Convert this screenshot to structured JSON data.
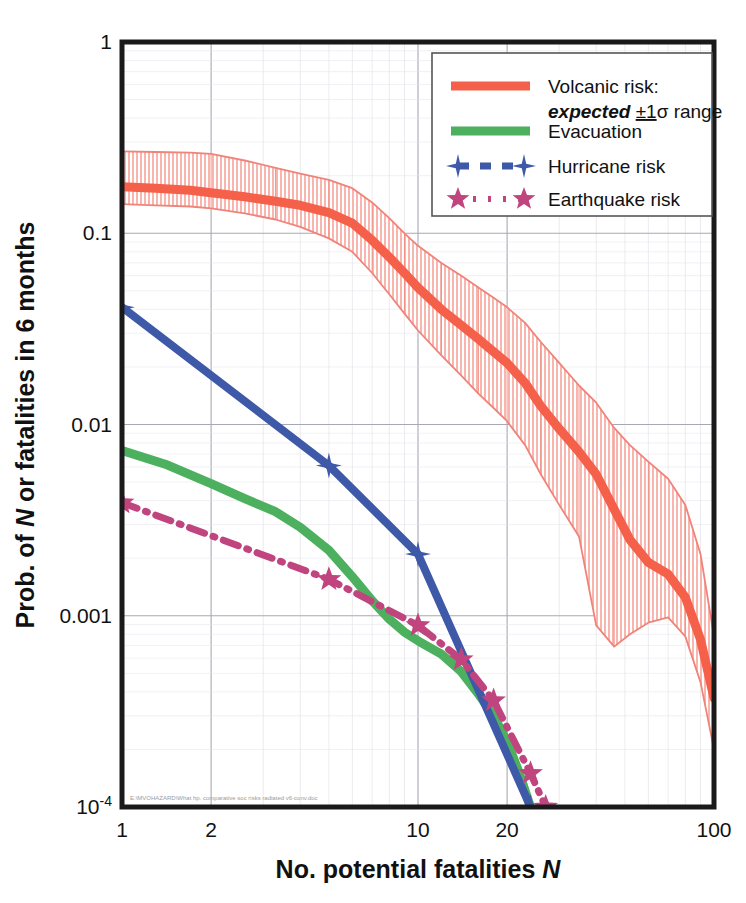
{
  "chart_data": {
    "type": "line",
    "title": "",
    "xlabel": "No. potential fatalities N",
    "ylabel": "Prob. of N or fatalities in 6 months",
    "xscale": "log",
    "yscale": "log",
    "xlim": [
      1,
      100
    ],
    "ylim": [
      0.0001,
      1
    ],
    "xticks": [
      "1",
      "2",
      "10",
      "20",
      "100"
    ],
    "xtick_values": [
      1,
      2,
      10,
      20,
      100
    ],
    "yticks": [
      "1",
      "0.1",
      "0.01",
      "0.001",
      "10-4"
    ],
    "ytick_values": [
      1,
      0.1,
      0.01,
      0.001,
      0.0001
    ],
    "grid": true,
    "legend_position": "top-right",
    "legend": [
      {
        "label": "Volcanic risk:",
        "label2": "expected",
        "label2b": "±1",
        "label2c": "σ",
        "label2d": " range",
        "color": "#f4604a",
        "style": "band"
      },
      {
        "label": "Evacuation",
        "color": "#4cb05f",
        "style": "thick-line"
      },
      {
        "label": "Hurricane risk",
        "color": "#3d59a8",
        "style": "dashed-star4"
      },
      {
        "label": "Earthquake risk",
        "color": "#c0457f",
        "style": "dashdot-star5"
      }
    ],
    "footnote": "E:\\MVOHAZARD\\What hp. comparative soc risks radiated v6-conv.doc",
    "series": [
      {
        "name": "Volcanic risk: expected",
        "color": "#f4604a",
        "x": [
          1,
          1.3,
          1.7,
          2,
          2.6,
          3.3,
          4,
          5,
          6,
          7,
          8,
          9,
          10,
          12,
          14,
          16,
          18,
          20,
          23,
          26,
          30,
          35,
          40,
          46,
          52,
          60,
          70,
          80,
          90,
          100
        ],
        "y": [
          0.175,
          0.172,
          0.168,
          0.163,
          0.155,
          0.147,
          0.14,
          0.128,
          0.113,
          0.092,
          0.075,
          0.062,
          0.052,
          0.04,
          0.033,
          0.028,
          0.024,
          0.021,
          0.0165,
          0.0125,
          0.0095,
          0.0072,
          0.0055,
          0.0036,
          0.0025,
          0.0019,
          0.00165,
          0.00125,
          0.00075,
          0.00037
        ]
      },
      {
        "name": "Volcanic risk: upper 1-sigma",
        "color": "#f0837a",
        "x": [
          1,
          1.3,
          1.7,
          2,
          2.6,
          3.3,
          4,
          5,
          6,
          7,
          8,
          9,
          10,
          12,
          14,
          16,
          18,
          20,
          23,
          26,
          30,
          35,
          40,
          46,
          52,
          60,
          70,
          80,
          90,
          100
        ],
        "y": [
          0.268,
          0.266,
          0.264,
          0.26,
          0.24,
          0.22,
          0.205,
          0.19,
          0.172,
          0.145,
          0.12,
          0.1,
          0.086,
          0.07,
          0.06,
          0.052,
          0.046,
          0.041,
          0.034,
          0.027,
          0.021,
          0.016,
          0.013,
          0.0096,
          0.0078,
          0.0064,
          0.0052,
          0.0038,
          0.0021,
          0.00078
        ]
      },
      {
        "name": "Volcanic risk: lower 1-sigma",
        "color": "#f0837a",
        "x": [
          1,
          1.3,
          1.7,
          2,
          2.6,
          3.3,
          4,
          5,
          6,
          7,
          8,
          9,
          10,
          12,
          14,
          16,
          18,
          20,
          23,
          26,
          30,
          35,
          40,
          46,
          52,
          60,
          70,
          80,
          90,
          100
        ],
        "y": [
          0.142,
          0.14,
          0.138,
          0.135,
          0.127,
          0.118,
          0.108,
          0.094,
          0.08,
          0.062,
          0.048,
          0.038,
          0.031,
          0.023,
          0.018,
          0.0145,
          0.0122,
          0.0104,
          0.0078,
          0.0055,
          0.0038,
          0.0026,
          0.00089,
          0.00069,
          0.0008,
          0.00092,
          0.00098,
          0.00078,
          0.00045,
          0.0002
        ]
      },
      {
        "name": "Evacuation",
        "color": "#4cb05f",
        "x": [
          1,
          1.4,
          2,
          2.6,
          3.3,
          4,
          5,
          6,
          7,
          8,
          9,
          10,
          12,
          14,
          16,
          18,
          20,
          22,
          24
        ],
        "y": [
          0.0073,
          0.0062,
          0.0049,
          0.0041,
          0.0035,
          0.0029,
          0.0022,
          0.0016,
          0.0012,
          0.00096,
          0.00082,
          0.00074,
          0.00063,
          0.00051,
          0.00039,
          0.0003,
          0.00022,
          0.00015,
          0.0001
        ]
      },
      {
        "name": "Hurricane risk",
        "color": "#3d59a8",
        "marker": "star4",
        "x": [
          1,
          5,
          10,
          24
        ],
        "y": [
          0.041,
          0.0061,
          0.0021,
          0.0001
        ]
      },
      {
        "name": "Earthquake risk",
        "color": "#c0457f",
        "marker": "star5",
        "x": [
          1,
          5,
          10,
          14,
          18,
          24,
          27
        ],
        "y": [
          0.0039,
          0.00155,
          0.00089,
          0.00059,
          0.00036,
          0.00015,
          0.0001
        ]
      }
    ]
  }
}
